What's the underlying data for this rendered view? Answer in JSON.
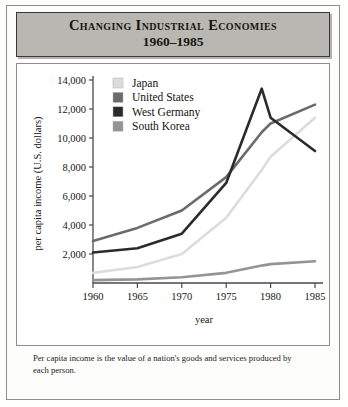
{
  "title": {
    "line1": "Changing Industrial Economies",
    "line2": "1960–1985"
  },
  "caption": "Per capita income is the value of a nation's goods and  services produced by each person.",
  "colors": {
    "japan": "#dcdcdc",
    "united_states": "#6b6b6b",
    "west_germany": "#2b2b2b",
    "south_korea": "#949494",
    "banner_fill": "#b9b7b2",
    "banner_border": "#3a3834",
    "axis": "#4a4945",
    "frame": "#8f8d88"
  },
  "chart_data": {
    "type": "line",
    "title": "Changing Industrial Economies 1960–1985",
    "xlabel": "year",
    "ylabel": "per capita income (U.S. dollars)",
    "xlim": [
      1960,
      1985
    ],
    "ylim": [
      0,
      14000
    ],
    "xticks": [
      "1960",
      "1965",
      "1970",
      "1975",
      "1980",
      "1985"
    ],
    "yticks": [
      "2,000",
      "4,000",
      "6,000",
      "8,000",
      "10,000",
      "12,000",
      "14,000"
    ],
    "grid": false,
    "legend_position": "upper-left-inside",
    "x": [
      1960,
      1965,
      1970,
      1975,
      1979,
      1980,
      1985
    ],
    "series": [
      {
        "name": "Japan",
        "color": "#dcdcdc",
        "values": [
          700,
          1100,
          2000,
          4500,
          7800,
          8700,
          11400
        ]
      },
      {
        "name": "United States",
        "color": "#6b6b6b",
        "values": [
          2900,
          3800,
          5000,
          7300,
          10400,
          11000,
          12300
        ]
      },
      {
        "name": "West Germany",
        "color": "#2b2b2b",
        "values": [
          2100,
          2400,
          3400,
          6900,
          13400,
          11400,
          9100
        ]
      },
      {
        "name": "South Korea",
        "color": "#949494",
        "values": [
          200,
          250,
          400,
          700,
          1200,
          1300,
          1500
        ]
      }
    ]
  },
  "legend": [
    {
      "label": "Japan",
      "color": "#dcdcdc"
    },
    {
      "label": "United States",
      "color": "#6b6b6b"
    },
    {
      "label": "West Germany",
      "color": "#2b2b2b"
    },
    {
      "label": "South Korea",
      "color": "#949494"
    }
  ]
}
